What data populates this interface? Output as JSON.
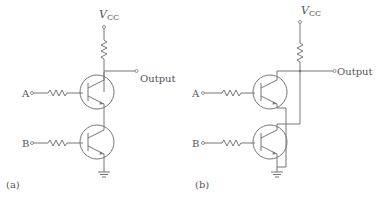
{
  "panels": [
    {
      "id": "a",
      "caption": "(a)",
      "supply": "V",
      "supply_sub": "CC",
      "output_label": "Output",
      "input_a": "A",
      "input_b": "B",
      "topology": "series (NAND)"
    },
    {
      "id": "b",
      "caption": "(b)",
      "supply": "V",
      "supply_sub": "CC",
      "output_label": "Output",
      "input_a": "A",
      "input_b": "B",
      "topology": "parallel (NOR)"
    }
  ]
}
